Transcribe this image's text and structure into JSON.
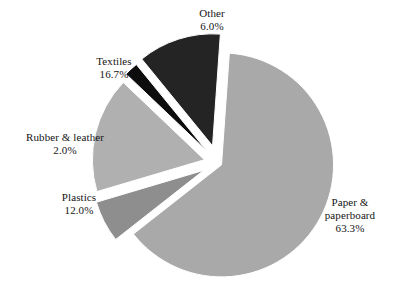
{
  "chart_data": {
    "type": "pie",
    "title": "",
    "subtitle": "",
    "legend_position": "none",
    "grid": false,
    "exploded": true,
    "units": "percent",
    "categories": [
      "Paper & paperboard",
      "Other",
      "Textiles",
      "Rubber & leather",
      "Plastics"
    ],
    "values": [
      63.3,
      6.0,
      16.7,
      2.0,
      12.0
    ],
    "slices": [
      {
        "label": "Paper &\npaperboard",
        "label_line1": "Paper &",
        "label_line2": "paperboard",
        "value": 63.3,
        "value_text": "63.3%",
        "color": "#a9a9a9"
      },
      {
        "label": "Other",
        "label_line1": "Other",
        "value": 6.0,
        "value_text": "6.0%",
        "color": "#8e8e8e"
      },
      {
        "label": "Textiles",
        "label_line1": "Textiles",
        "value": 16.7,
        "value_text": "16.7%",
        "color": "#b0b0b0"
      },
      {
        "label": "Rubber & leather",
        "label_line1": "Rubber & leather",
        "value": 2.0,
        "value_text": "2.0%",
        "color": "#0d0d0d"
      },
      {
        "label": "Plastics",
        "label_line1": "Plastics",
        "value": 12.0,
        "value_text": "12.0%",
        "color": "#242424"
      }
    ],
    "background_color": "#ffffff",
    "text_color": "#141414"
  }
}
